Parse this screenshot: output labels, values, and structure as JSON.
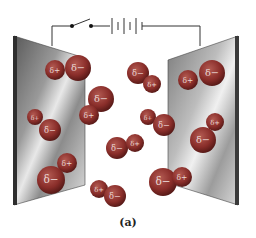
{
  "figure": {
    "caption": "(a)"
  },
  "circuit": {
    "switch_state": "open",
    "battery_cells": 4,
    "wire_color": "#333333"
  },
  "plates": {
    "left": {
      "points": "14,36 85,58 85,185 14,205"
    },
    "right": {
      "points": "168,60 238,36 238,205 168,183"
    }
  },
  "molecule_color": "#8a2e2a",
  "molecules": [
    {
      "atoms": [
        {
          "x": 55,
          "y": 70,
          "r": 10,
          "label": "δ+"
        },
        {
          "x": 78,
          "y": 68,
          "r": 13,
          "label": "δ−"
        }
      ]
    },
    {
      "atoms": [
        {
          "x": 101,
          "y": 99,
          "r": 13,
          "label": "δ−"
        },
        {
          "x": 89,
          "y": 115,
          "r": 10,
          "label": "δ+"
        }
      ]
    },
    {
      "atoms": [
        {
          "x": 138,
          "y": 73,
          "r": 11,
          "label": "δ−"
        },
        {
          "x": 152,
          "y": 84,
          "r": 9,
          "label": "δ+"
        }
      ]
    },
    {
      "atoms": [
        {
          "x": 188,
          "y": 80,
          "r": 10,
          "label": "δ+"
        },
        {
          "x": 212,
          "y": 73,
          "r": 13,
          "label": "δ−"
        }
      ]
    },
    {
      "atoms": [
        {
          "x": 35,
          "y": 117,
          "r": 8,
          "label": "δ+"
        },
        {
          "x": 50,
          "y": 130,
          "r": 11,
          "label": "δ−"
        }
      ]
    },
    {
      "atoms": [
        {
          "x": 148,
          "y": 117,
          "r": 8,
          "label": "δ+"
        },
        {
          "x": 164,
          "y": 125,
          "r": 11,
          "label": "δ−"
        }
      ]
    },
    {
      "atoms": [
        {
          "x": 215,
          "y": 122,
          "r": 9,
          "label": "δ+"
        },
        {
          "x": 203,
          "y": 140,
          "r": 13,
          "label": "δ−"
        }
      ]
    },
    {
      "atoms": [
        {
          "x": 117,
          "y": 148,
          "r": 11,
          "label": "δ−"
        },
        {
          "x": 135,
          "y": 143,
          "r": 9,
          "label": "δ+"
        }
      ]
    },
    {
      "atoms": [
        {
          "x": 67,
          "y": 163,
          "r": 10,
          "label": "δ+"
        },
        {
          "x": 51,
          "y": 180,
          "r": 14,
          "label": "δ−"
        }
      ]
    },
    {
      "atoms": [
        {
          "x": 163,
          "y": 182,
          "r": 14,
          "label": "δ−"
        },
        {
          "x": 182,
          "y": 177,
          "r": 10,
          "label": "δ+"
        }
      ]
    },
    {
      "atoms": [
        {
          "x": 99,
          "y": 189,
          "r": 9,
          "label": "δ+"
        },
        {
          "x": 115,
          "y": 196,
          "r": 11,
          "label": "δ−"
        }
      ]
    }
  ]
}
